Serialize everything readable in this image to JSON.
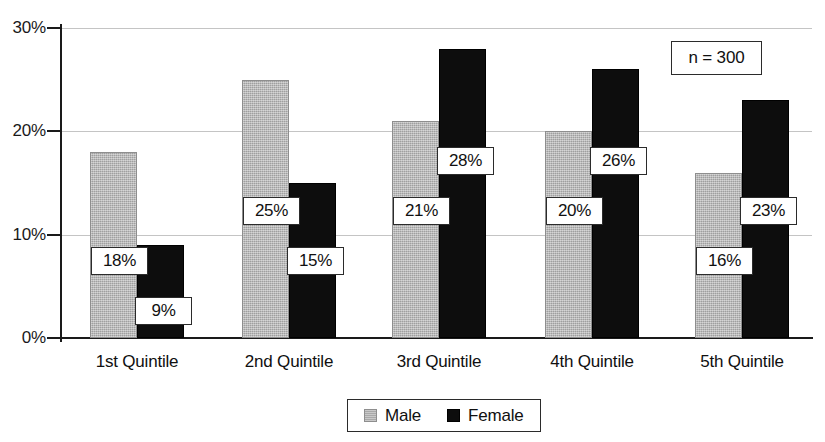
{
  "chart_data": {
    "type": "bar",
    "title": "",
    "subtitle": "",
    "xlabel": "",
    "ylabel": "",
    "categories": [
      "1st Quintile",
      "2nd Quintile",
      "3rd Quintile",
      "4th Quintile",
      "5th Quintile"
    ],
    "series": [
      {
        "name": "Male",
        "color": "#b2b2b2",
        "values": [
          18,
          25,
          21,
          20,
          16
        ],
        "labels": [
          "18%",
          "25%",
          "21%",
          "20%",
          "16%"
        ]
      },
      {
        "name": "Female",
        "color": "#0d0d0d",
        "values": [
          9,
          15,
          28,
          26,
          23
        ],
        "labels": [
          "9%",
          "15%",
          "28%",
          "26%",
          "23%"
        ]
      }
    ],
    "ylim": [
      0,
      30
    ],
    "ytick_values": [
      0,
      10,
      20,
      30
    ],
    "ytick_labels": [
      "0%",
      "10%",
      "20%",
      "30%"
    ],
    "grid": "horizontal",
    "legend_position": "bottom-center",
    "annotations": [
      {
        "text": "n = 300",
        "position": "top-right"
      }
    ]
  },
  "legend": {
    "entries": [
      {
        "label": "Male",
        "swatch": "male-swatch"
      },
      {
        "label": "Female",
        "swatch": "female-swatch"
      }
    ]
  },
  "annotation": {
    "sample_size_text": "n = 300"
  }
}
